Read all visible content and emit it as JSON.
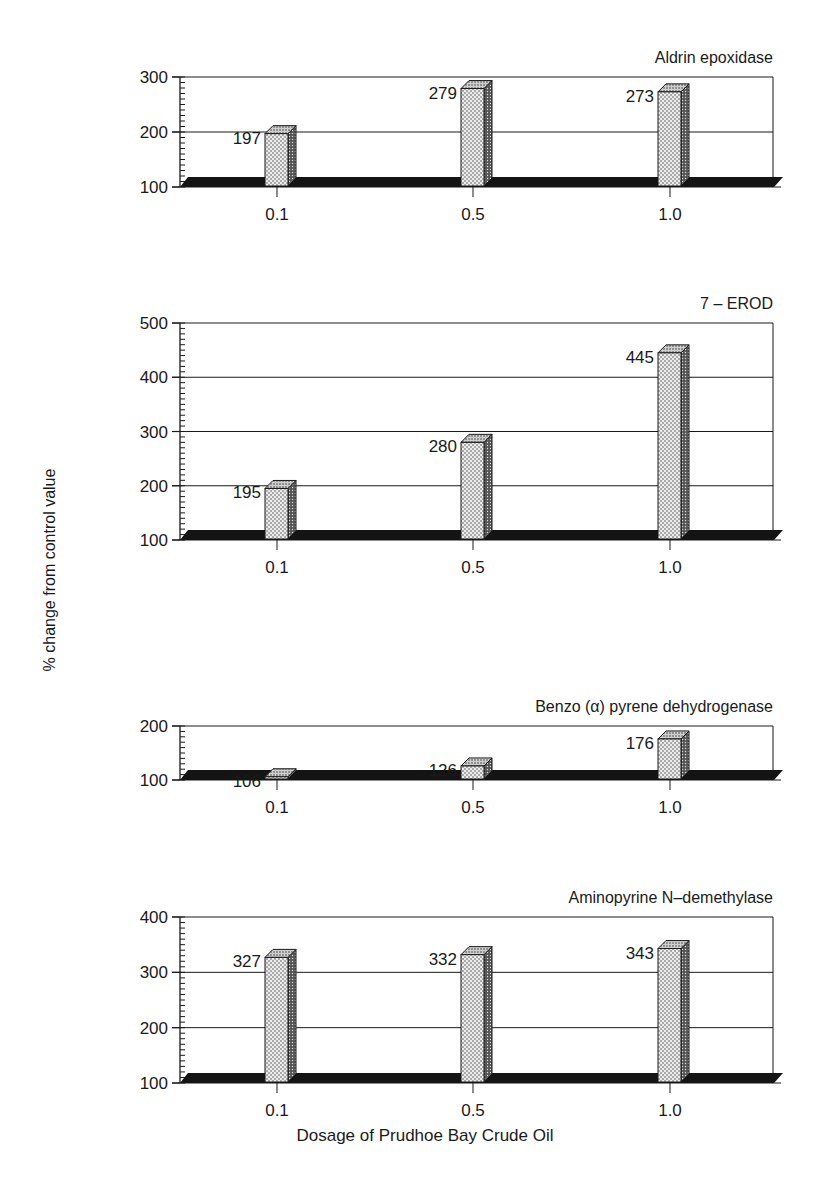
{
  "figure": {
    "ylabel": "% change from control value",
    "xlabel": "Dosage of Prudhoe Bay Crude Oil"
  },
  "chart_data": [
    {
      "type": "bar",
      "title": "Aldrin epoxidase",
      "categories": [
        "0.1",
        "0.5",
        "1.0"
      ],
      "values": [
        197,
        279,
        273
      ],
      "ylim": [
        100,
        300
      ],
      "yticks": [
        100,
        200,
        300
      ],
      "xlabel": "Dosage of Prudhoe Bay Crude Oil",
      "ylabel": "% change from control value",
      "grid": true
    },
    {
      "type": "bar",
      "title": "7 – EROD",
      "categories": [
        "0.1",
        "0.5",
        "1.0"
      ],
      "values": [
        195,
        280,
        445
      ],
      "ylim": [
        100,
        500
      ],
      "yticks": [
        100,
        200,
        300,
        400,
        500
      ],
      "xlabel": "Dosage of Prudhoe Bay Crude Oil",
      "ylabel": "% change from control value",
      "grid": true
    },
    {
      "type": "bar",
      "title": "Benzo (α) pyrene dehydrogenase",
      "categories": [
        "0.1",
        "0.5",
        "1.0"
      ],
      "values": [
        106,
        126,
        176
      ],
      "ylim": [
        100,
        200
      ],
      "yticks": [
        100,
        200
      ],
      "xlabel": "Dosage of Prudhoe Bay Crude Oil",
      "ylabel": "% change from control value",
      "grid": true
    },
    {
      "type": "bar",
      "title": "Aminopyrine N–demethylase",
      "categories": [
        "0.1",
        "0.5",
        "1.0"
      ],
      "values": [
        327,
        332,
        343
      ],
      "ylim": [
        100,
        400
      ],
      "yticks": [
        100,
        200,
        300,
        400
      ],
      "xlabel": "Dosage of Prudhoe Bay Crude Oil",
      "ylabel": "% change from control value",
      "grid": true
    }
  ],
  "colors": {
    "ink": "#1a1a1a",
    "bar_front": "#e2e2e2",
    "bar_top": "#bdbdbd",
    "bar_side": "#6f6f6f",
    "floor": "#141414"
  }
}
